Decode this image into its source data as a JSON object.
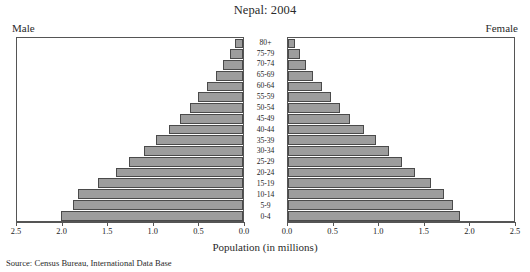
{
  "chart_data": {
    "type": "bar",
    "title": "Nepal: 2004",
    "subtype": "population-pyramid",
    "xlabel": "Population (in millions)",
    "ylabel": "",
    "categories": [
      "80+",
      "75-79",
      "70-74",
      "65-69",
      "60-64",
      "55-59",
      "50-54",
      "45-49",
      "40-44",
      "35-39",
      "30-34",
      "25-29",
      "20-24",
      "15-19",
      "10-14",
      "5-9",
      "0-4"
    ],
    "series": [
      {
        "name": "Male",
        "side": "left",
        "values": [
          0.09,
          0.14,
          0.22,
          0.3,
          0.4,
          0.5,
          0.59,
          0.7,
          0.82,
          0.96,
          1.1,
          1.26,
          1.4,
          1.6,
          1.82,
          1.88,
          2.01
        ]
      },
      {
        "name": "Female",
        "side": "right",
        "values": [
          0.08,
          0.13,
          0.2,
          0.28,
          0.38,
          0.48,
          0.57,
          0.69,
          0.84,
          0.97,
          1.12,
          1.26,
          1.4,
          1.58,
          1.73,
          1.82,
          1.9
        ]
      }
    ],
    "xlim_left": [
      2.5,
      0.0
    ],
    "xlim_right": [
      0.0,
      2.5
    ],
    "xticks_left": [
      "2.5",
      "2.0",
      "1.5",
      "1.0",
      "0.5",
      "0.0"
    ],
    "xticks_right": [
      "0.0",
      "0.5",
      "1.0",
      "1.5",
      "2.0",
      "2.5"
    ],
    "xtick_values": [
      0.0,
      0.5,
      1.0,
      1.5,
      2.0,
      2.5
    ],
    "axis_max": 2.5,
    "grid": false,
    "legend": "side-labels",
    "bar_fill": "#9d9d9d",
    "bar_stroke": "#4a4a4a",
    "source": "Source: Census Bureau, International Data Base"
  },
  "labels": {
    "male": "Male",
    "female": "Female"
  },
  "top_artifact": ""
}
